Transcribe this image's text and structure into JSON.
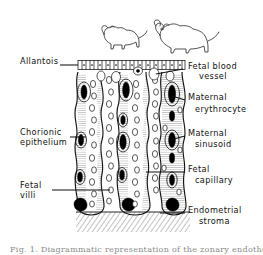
{
  "figure": {
    "caption": "Fig. 1.  Diagrammatic representation of the zonary endotheliochorial placenta",
    "ink_color": "#111111",
    "background_color": "#ffffff",
    "caption_color": "#8a8a8a"
  },
  "animals": [
    {
      "name": "small-dog-silhouette",
      "label": ""
    },
    {
      "name": "large-dog-silhouette",
      "label": ""
    }
  ],
  "labels": {
    "allantois": {
      "text": "Allantois",
      "text2": "",
      "side": "left"
    },
    "chorionic_epithelium": {
      "text": "Chorionic",
      "text2": "epithelium",
      "side": "left"
    },
    "fetal_villi": {
      "text": "Fetal",
      "text2": "villi",
      "side": "left"
    },
    "fetal_blood_vessel": {
      "text": "Fetal  blood",
      "text2": "vessel",
      "side": "right"
    },
    "maternal_erythrocyte": {
      "text": "Maternal",
      "text2": "erythrocyte",
      "side": "right"
    },
    "maternal_sinusoid": {
      "text": "Maternal",
      "text2": "sinusoid",
      "side": "right"
    },
    "fetal_capillary": {
      "text": "Fetal",
      "text2": "capillary",
      "side": "right"
    },
    "endometrial_stroma": {
      "text": "Endometrial",
      "text2": "stroma",
      "side": "right"
    }
  },
  "structures": {
    "allantois_band": "row of cuboidal allantoic epithelial cells",
    "villi_count": 3,
    "stroma": "diagonally hatched endometrial stroma at base"
  }
}
